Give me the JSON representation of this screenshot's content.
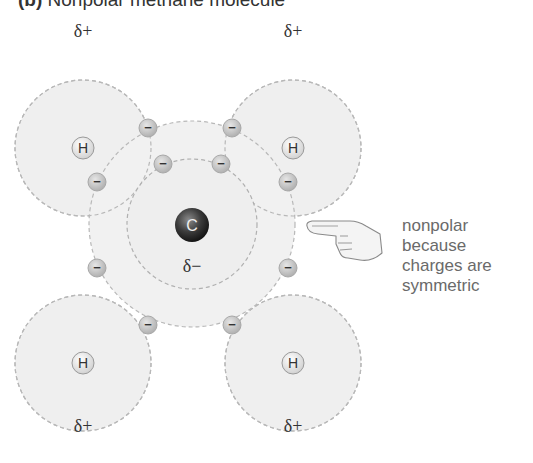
{
  "title": {
    "label": "(b)",
    "text": "Nonpolar methane molecule"
  },
  "atoms": {
    "carbon": {
      "symbol": "C",
      "charge": "δ−",
      "x": 192,
      "y": 224
    },
    "hydrogens": [
      {
        "symbol": "H",
        "charge": "δ+",
        "x": 83,
        "y": 148
      },
      {
        "symbol": "H",
        "charge": "δ+",
        "x": 293,
        "y": 148
      },
      {
        "symbol": "H",
        "charge": "δ+",
        "x": 83,
        "y": 363
      },
      {
        "symbol": "H",
        "charge": "δ+",
        "x": 293,
        "y": 363
      }
    ]
  },
  "electron_symbol": "−",
  "annotation": {
    "lines": [
      "nonpolar",
      "because",
      "charges are",
      "symmetric"
    ],
    "pointer": "pointing-hand-icon"
  },
  "colors": {
    "shell_fill": "#f0f0f0",
    "dash": "#b5b5b5",
    "electron": "#c8c8c8",
    "carbon": "#3a3a3a",
    "text": "#333333",
    "annotation_text": "#6a6a6a"
  }
}
